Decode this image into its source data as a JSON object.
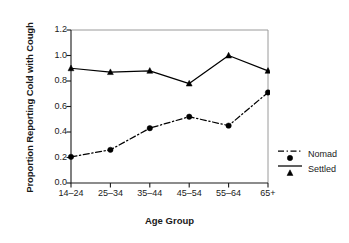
{
  "chart_data": {
    "type": "line",
    "title": "",
    "xlabel": "Age Group",
    "ylabel": "Proportion Reporting Cold with Cough",
    "categories": [
      "14–24",
      "25–34",
      "35–44",
      "45–54",
      "55–64",
      "65+"
    ],
    "ylim": [
      0.0,
      1.2
    ],
    "ytick_labels": [
      "1.2",
      "1.0",
      "0.8",
      "0.6",
      "0.4",
      "0.2",
      "0.0"
    ],
    "ytick_values": [
      1.2,
      1.0,
      0.8,
      0.6,
      0.4,
      0.2,
      0.0
    ],
    "grid": false,
    "legend_position": "right-outside",
    "series": [
      {
        "name": "Nomad",
        "values": [
          0.205,
          0.26,
          0.43,
          0.52,
          0.45,
          0.71
        ],
        "marker": "circle",
        "linestyle": "dashdot",
        "color": "#000000"
      },
      {
        "name": "Settled",
        "values": [
          0.9,
          0.87,
          0.88,
          0.78,
          1.0,
          0.88
        ],
        "marker": "triangle",
        "linestyle": "solid",
        "color": "#000000"
      }
    ]
  },
  "legend": {
    "items": [
      {
        "label": "Nomad",
        "marker": "circle",
        "linestyle": "dashdot"
      },
      {
        "label": "Settled",
        "marker": "triangle",
        "linestyle": "solid"
      }
    ]
  },
  "colors": {
    "axis": "#1a1a1a",
    "frame_light": "#9a9a9a",
    "series": "#000000",
    "background": "#ffffff"
  }
}
